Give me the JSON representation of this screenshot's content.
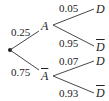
{
  "diagram": {
    "type": "probability-tree",
    "root": {
      "label": ""
    },
    "level1": [
      {
        "event": "A",
        "negated": false,
        "prob": "0.25",
        "children": [
          {
            "event": "D",
            "negated": false,
            "prob": "0.05"
          },
          {
            "event": "D",
            "negated": true,
            "prob": "0.95"
          }
        ]
      },
      {
        "event": "A",
        "negated": true,
        "prob": "0.75",
        "children": [
          {
            "event": "D",
            "negated": false,
            "prob": "0.07"
          },
          {
            "event": "D",
            "negated": true,
            "prob": "0.93"
          }
        ]
      }
    ]
  },
  "colors": {
    "line": "#333333",
    "text": "#222222",
    "background": "#ffffff"
  }
}
